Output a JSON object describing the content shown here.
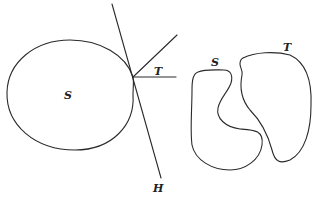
{
  "figure": {
    "left": {
      "region_label": "S",
      "ray_label": "T",
      "line_label": "H"
    },
    "right": {
      "region_s_label": "S",
      "region_t_label": "T"
    }
  },
  "colors": {
    "stroke": "#2a2a2a",
    "background": "#ffffff"
  }
}
